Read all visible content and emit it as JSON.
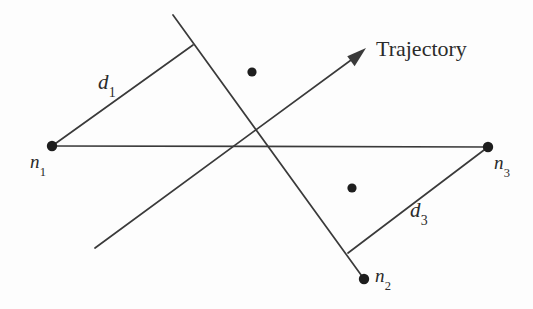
{
  "figure": {
    "background_color": "#fdfdfd",
    "stroke_color": "#3a3a3a",
    "text_color": "#2b2b2b"
  },
  "labels": {
    "n1": "n",
    "n1_sub": "1",
    "n2": "n",
    "n2_sub": "2",
    "n3": "n",
    "n3_sub": "3",
    "d1": "d",
    "d1_sub": "1",
    "d3": "d",
    "d3_sub": "3",
    "trajectory": "Trajectory"
  },
  "chart_data": {
    "type": "diagram",
    "xlim": [
      0,
      533
    ],
    "ylim": [
      0,
      309
    ],
    "grid": false,
    "legend": "none",
    "nodes": [
      {
        "name": "n1",
        "label": "n₁",
        "x": 52,
        "y": 146,
        "radius": 5.2
      },
      {
        "name": "n2",
        "label": "n₂",
        "x": 364,
        "y": 279,
        "radius": 5.2
      },
      {
        "name": "n3",
        "label": "n₃",
        "x": 488,
        "y": 147,
        "radius": 5.2
      }
    ],
    "point_markers": [
      {
        "name": "marker-upper",
        "x": 252,
        "y": 72,
        "radius": 4.6
      },
      {
        "name": "marker-lower",
        "x": 352,
        "y": 188,
        "radius": 4.6
      }
    ],
    "lines": [
      {
        "name": "baseline-n1-n3",
        "x1": 52,
        "y1": 146,
        "x2": 488,
        "y2": 147,
        "width": 1.7
      },
      {
        "name": "trajectory-line",
        "x1": 95,
        "y1": 248,
        "x2": 362,
        "y2": 52,
        "width": 1.7
      },
      {
        "name": "node-line-n2",
        "x1": 173,
        "y1": 15,
        "x2": 364,
        "y2": 279,
        "width": 1.7
      },
      {
        "name": "distance-d1",
        "x1": 52,
        "y1": 146,
        "x2": 193,
        "y2": 45,
        "width": 1.7
      },
      {
        "name": "distance-d3",
        "x1": 488,
        "y1": 147,
        "x2": 348,
        "y2": 253,
        "width": 1.7
      }
    ],
    "arrow": {
      "name": "trajectory-arrowhead",
      "tip_x": 366,
      "tip_y": 48,
      "angle_deg": -36.3,
      "length": 20,
      "half_width": 8
    },
    "label_positions": [
      {
        "name": "n1-label",
        "text": "n₁",
        "x": 30,
        "y": 152
      },
      {
        "name": "n2-label",
        "text": "n₂",
        "x": 375,
        "y": 266
      },
      {
        "name": "n3-label",
        "text": "n₃",
        "x": 494,
        "y": 153
      },
      {
        "name": "d1-label",
        "text": "d₁",
        "x": 98,
        "y": 72
      },
      {
        "name": "d3-label",
        "text": "d₃",
        "x": 410,
        "y": 200
      },
      {
        "name": "trajectory-label",
        "text": "Trajectory",
        "x": 376,
        "y": 38
      }
    ]
  }
}
